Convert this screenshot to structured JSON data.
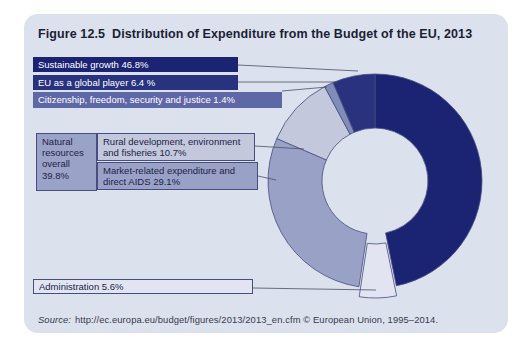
{
  "figure": {
    "label": "Figure 12.5",
    "title": "Distribution of Expenditure from the Budget of the EU, 2013"
  },
  "labels": {
    "sustainable": "Sustainable growth 46.8%",
    "eu_global": "EU as a global player 6.4 %",
    "citizenship": "Citizenship, freedom, security and justice 1.4%",
    "natural_group": "Natural resources overall 39.8%",
    "rural": "Rural development, environment and fisheries 10.7%",
    "market": "Market-related expenditure and direct AIDS 29.1%",
    "administration": "Administration 5.6%"
  },
  "source": {
    "prefix": "Source:",
    "text": "http://ec.europa.eu/budget/figures/2013/2013_en.cfm © European Union, 1995–2014."
  },
  "colors": {
    "panel_background": "#dce1ee",
    "navy": "#1b2473",
    "eu_global_navy": "#28327f",
    "citizenship_slice": "#828cb8",
    "citizenship_box": "#5f68a7",
    "market_slate": "#99a1c7",
    "rural_light": "#c3c8dd",
    "administration_pale": "#e2e5f1",
    "natural_box": "#9aa2c8",
    "outline": "#454e7e",
    "leader_line": "#4a4f66"
  },
  "chart_data": {
    "type": "pie",
    "subtype": "donut",
    "title": "Distribution of Expenditure from the Budget of the EU, 2013",
    "unit": "%",
    "start_angle_deg": 0,
    "direction": "clockwise",
    "slices": [
      {
        "label": "Sustainable growth",
        "value": 46.8,
        "color": "#1b2473",
        "exploded": false
      },
      {
        "label": "Administration",
        "value": 5.6,
        "color": "#e2e5f1",
        "exploded": true
      },
      {
        "label": "Market-related expenditure and direct AIDS",
        "value": 29.1,
        "color": "#99a1c7",
        "exploded": false
      },
      {
        "label": "Rural development, environment and fisheries",
        "value": 10.7,
        "color": "#c3c8dd",
        "exploded": false
      },
      {
        "label": "Citizenship, freedom, security and justice",
        "value": 1.4,
        "color": "#828cb8",
        "exploded": false
      },
      {
        "label": "EU as a global player",
        "value": 6.4,
        "color": "#28327f",
        "exploded": false
      }
    ],
    "groups": [
      {
        "label": "Natural resources overall",
        "value": 39.8,
        "members": [
          "Rural development, environment and fisheries",
          "Market-related expenditure and direct AIDS"
        ]
      }
    ]
  }
}
